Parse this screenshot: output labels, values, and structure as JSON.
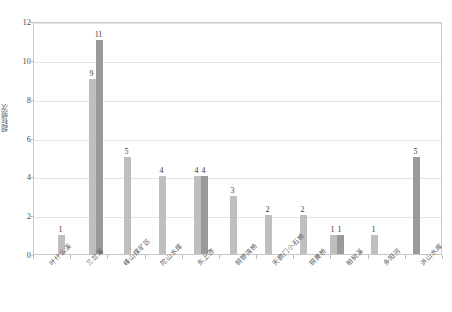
{
  "chart_data": {
    "type": "bar",
    "title": "",
    "xlabel": "",
    "ylabel": "超标频次",
    "ylim": [
      0,
      12
    ],
    "ytick_step": 2,
    "grid": true,
    "legend": "none",
    "categories": [
      "叶什么溪",
      "三岔溪",
      "峰山煤矿区",
      "陀山水库",
      "东上游",
      "铜锣湾桥",
      "天鹅门小石桥",
      "铜黄桥",
      "柏树溪",
      "多阳河",
      "洪山水库"
    ],
    "bars": [
      {
        "category_index": 0,
        "value": 1,
        "series": "A",
        "x": 57,
        "label": "1"
      },
      {
        "category_index": 1,
        "value": 9,
        "series": "A",
        "x": 88,
        "label": "9"
      },
      {
        "category_index": 1,
        "value": 11,
        "series": "B",
        "x": 95,
        "label": "11"
      },
      {
        "category_index": 2,
        "value": 5,
        "series": "A",
        "x": 123,
        "label": "5"
      },
      {
        "category_index": 3,
        "value": 4,
        "series": "A",
        "x": 158,
        "label": "4"
      },
      {
        "category_index": 4,
        "value": 4,
        "series": "A",
        "x": 193,
        "label": "4"
      },
      {
        "category_index": 4,
        "value": 4,
        "series": "B",
        "x": 200,
        "label": "4"
      },
      {
        "category_index": 5,
        "value": 3,
        "series": "A",
        "x": 229,
        "label": "3"
      },
      {
        "category_index": 6,
        "value": 2,
        "series": "A",
        "x": 264,
        "label": "2"
      },
      {
        "category_index": 7,
        "value": 2,
        "series": "A",
        "x": 299,
        "label": "2"
      },
      {
        "category_index": 8,
        "value": 1,
        "series": "A",
        "x": 329,
        "label": "1"
      },
      {
        "category_index": 8,
        "value": 1,
        "series": "B",
        "x": 336,
        "label": "1"
      },
      {
        "category_index": 9,
        "value": 1,
        "series": "A",
        "x": 370,
        "label": "1"
      },
      {
        "category_index": 10,
        "value": 5,
        "series": "B",
        "x": 412,
        "label": "5"
      }
    ],
    "series_colors": {
      "A": "#bfbfbf",
      "B": "#9a9a9a"
    },
    "ytick_labels": [
      "0",
      "2",
      "4",
      "6",
      "8",
      "10",
      "12"
    ],
    "axis_color": "#c9c9c9",
    "grid_color": "#e4e4e4"
  }
}
